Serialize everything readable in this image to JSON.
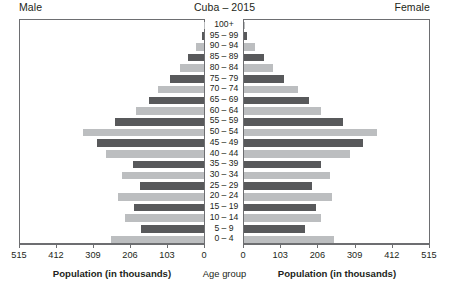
{
  "labels": {
    "male": "Male",
    "female": "Female",
    "title": "Cuba – 2015",
    "center_caption": "Age group",
    "male_caption": "Population (in thousands)",
    "female_caption": "Population (in thousands)"
  },
  "chart_data": {
    "type": "bar",
    "title": "Cuba – 2015",
    "subtitle": "",
    "orientation": "population-pyramid",
    "xlabel": "Population (in thousands)",
    "ylabel": "Age group",
    "xlim": [
      0,
      515
    ],
    "ticks": [
      515,
      412,
      309,
      206,
      103,
      0
    ],
    "tick_labels": [
      "515",
      "412",
      "309",
      "206",
      "103",
      "0"
    ],
    "grid": false,
    "legend_position": "none",
    "colors": {
      "dark_bar": "#58595b",
      "light_bar": "#bcbec0",
      "frame": "#6d6e71",
      "text": "#231f20",
      "background": "#ffffff"
    },
    "categories": [
      "100+",
      "95 – 99",
      "90 – 94",
      "85 – 89",
      "80 – 84",
      "75 – 79",
      "70 – 74",
      "65 – 69",
      "60 – 64",
      "55 – 59",
      "50 – 54",
      "45 – 49",
      "40 – 44",
      "35 – 39",
      "30 – 34",
      "25 – 29",
      "20 – 24",
      "15 – 19",
      "10 – 14",
      "5 – 9",
      "0 – 4"
    ],
    "series": [
      {
        "name": "Male",
        "side": "left",
        "values": [
          1,
          6,
          22,
          45,
          68,
          95,
          128,
          155,
          190,
          250,
          340,
          300,
          275,
          200,
          230,
          180,
          240,
          195,
          220,
          175,
          260
        ]
      },
      {
        "name": "Female",
        "side": "right",
        "values": [
          2,
          9,
          30,
          55,
          82,
          110,
          150,
          182,
          215,
          275,
          370,
          330,
          295,
          215,
          240,
          190,
          245,
          200,
          215,
          170,
          250
        ]
      }
    ],
    "shading": [
      "light",
      "dark",
      "light",
      "dark",
      "light",
      "dark",
      "light",
      "dark",
      "light",
      "dark",
      "light",
      "dark",
      "light",
      "dark",
      "light",
      "dark",
      "light",
      "dark",
      "light",
      "dark"
    ]
  }
}
